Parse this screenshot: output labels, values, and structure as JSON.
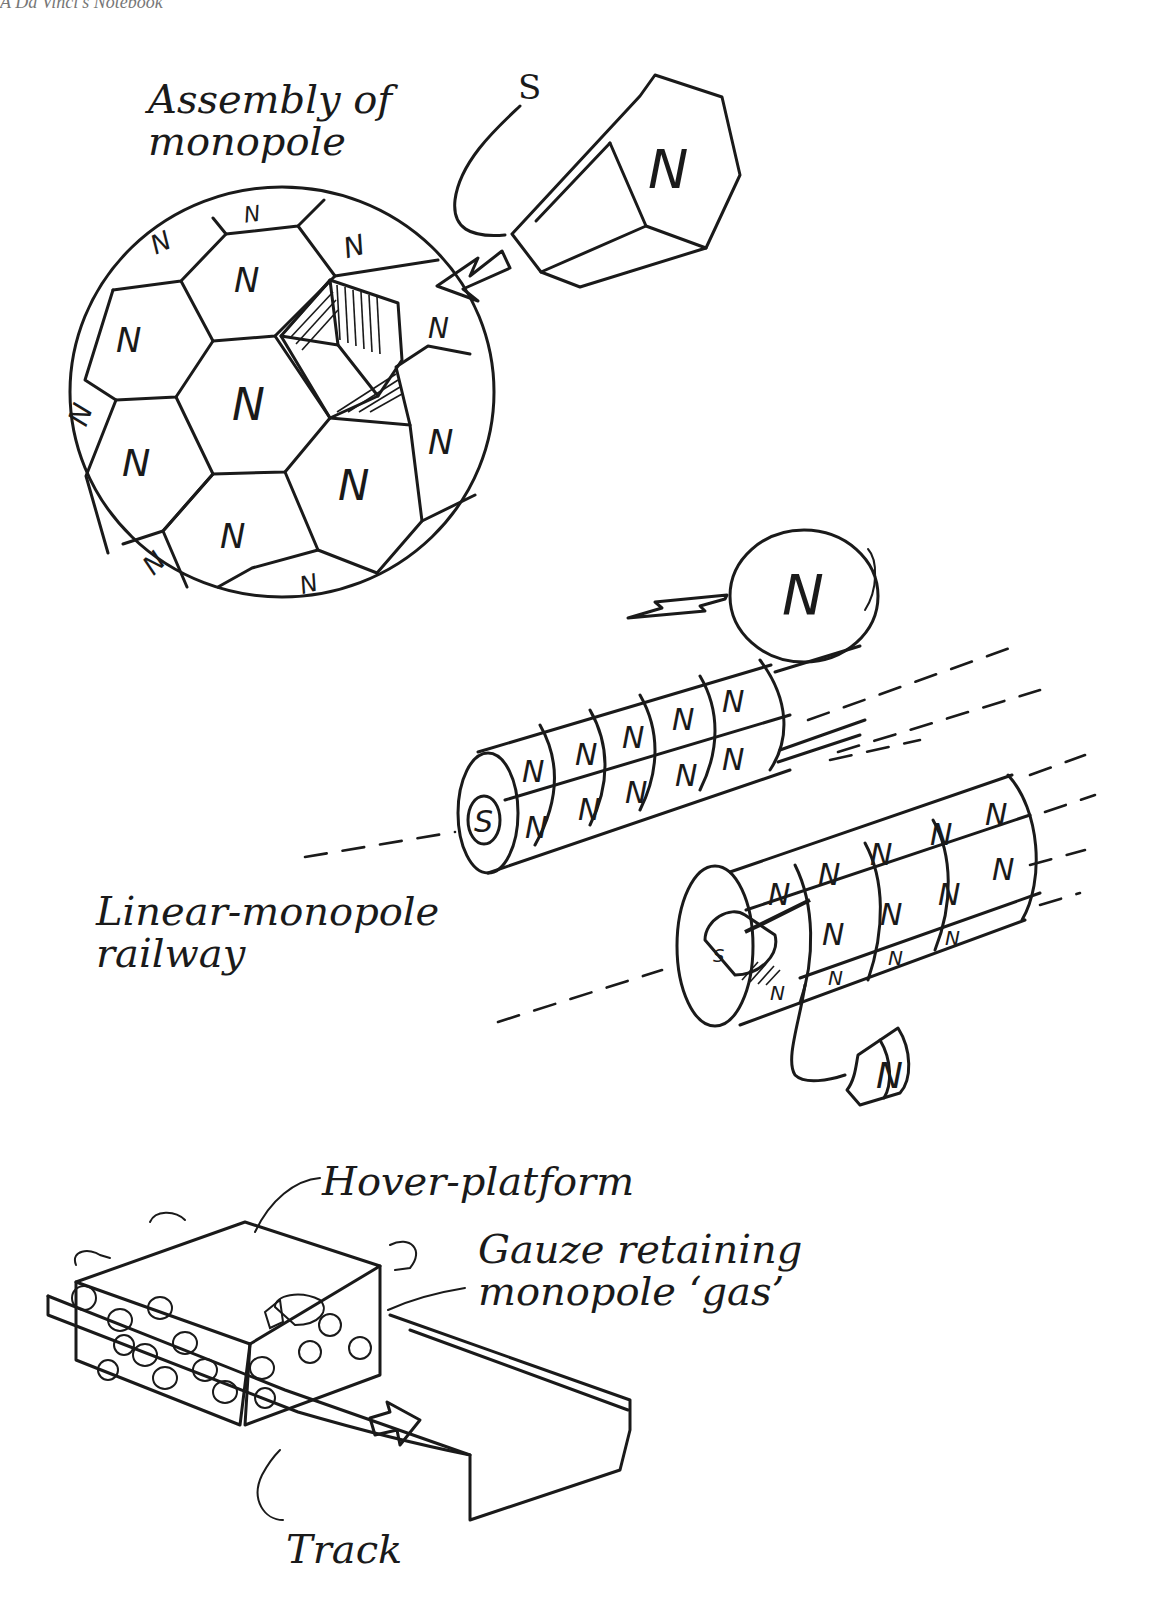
{
  "page": {
    "running_head": "A Da Vinci's Notebook",
    "ink_color": "#1a1a1a",
    "paper_color": "#ffffff"
  },
  "figures": {
    "monopole_assembly": {
      "caption_line1": "Assembly of",
      "caption_line2": "monopole",
      "south_label": "S",
      "north_label": "N",
      "face_label": "N"
    },
    "linear_railway": {
      "caption_line1": "Linear-monopole",
      "caption_line2": "railway",
      "ball_label": "N",
      "cylinder_core_label": "S",
      "cylinder_face_label": "N",
      "detached_segment_label": "N"
    },
    "hover_platform": {
      "platform_label": "Hover-platform",
      "gauze_label_line1": "Gauze retaining",
      "gauze_label_line2": "monopole ‘gas’",
      "track_label": "Track"
    }
  }
}
